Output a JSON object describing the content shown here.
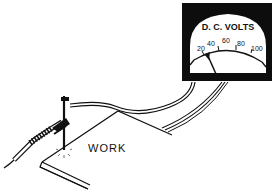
{
  "meter": {
    "title": "D. C. VOLTS",
    "scale": [
      "20",
      "40",
      "60",
      "80",
      "100"
    ],
    "needle_value": 40
  },
  "work_label": "WORK",
  "colors": {
    "ink": "#111111",
    "paper": "#ffffff"
  }
}
